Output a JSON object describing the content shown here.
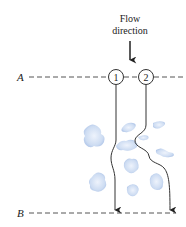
{
  "diagram": {
    "flow_label_line1": "Flow",
    "flow_label_line2": "direction",
    "line_a_label": "A",
    "line_b_label": "B",
    "path1_label": "1",
    "path2_label": "2",
    "colors": {
      "ink": "#222222",
      "dash": "#555555",
      "particle_fill": "#c9d8f0",
      "particle_edge": "#9fb7e0"
    }
  }
}
